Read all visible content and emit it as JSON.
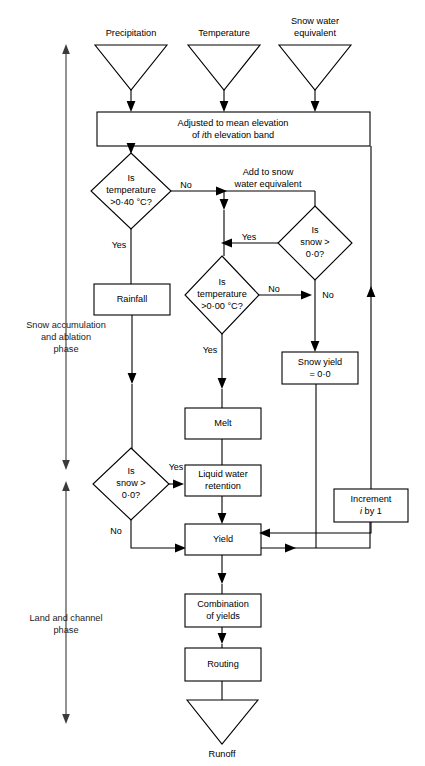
{
  "figure": {
    "type": "flowchart",
    "background_color": "#ffffff",
    "line_color": "#000000",
    "caption": ""
  },
  "inputs": [
    {
      "id": "precipitation",
      "label": "Precipitation",
      "shape": "triangle"
    },
    {
      "id": "temperature",
      "label": "Temperature",
      "shape": "triangle"
    },
    {
      "id": "snow-water-equivalent",
      "label_line1": "Snow water",
      "label_line2": "equivalent",
      "shape": "triangle"
    }
  ],
  "processes": {
    "adjusted": {
      "line1": "Adjusted to mean elevation",
      "line2_pre": "of ",
      "line2_italic": "i",
      "line2_post": "th elevation band"
    },
    "add_to_swe": {
      "line1": "Add to snow",
      "line2": "water equivalent"
    },
    "rainfall": {
      "line1": "Rainfall"
    },
    "snow_yield": {
      "line1": "Snow yield",
      "line2": "= 0·0"
    },
    "melt": {
      "line1": "Melt"
    },
    "liquid_water_retention": {
      "line1": "Liquid water",
      "line2": "retention"
    },
    "yield": {
      "line1": "Yield"
    },
    "increment": {
      "line1": "Increment",
      "line2_italic": "i",
      "line2_post": " by 1"
    },
    "combination": {
      "line1": "Combination",
      "line2": "of yields"
    },
    "routing": {
      "line1": "Routing"
    }
  },
  "decisions": {
    "temp_040": {
      "line1": "Is",
      "line2": "temperature",
      "line3": ">0·40 °C?"
    },
    "snow_top": {
      "line1": "Is",
      "line2": "snow >",
      "line3": "0·0?"
    },
    "temp_000": {
      "line1": "Is",
      "line2": "temperature",
      "line3": ">0·00 °C?"
    },
    "snow_bottom": {
      "line1": "Is",
      "line2": "snow >",
      "line3": "0·0?"
    }
  },
  "branch_labels": {
    "temp040_no": "No",
    "temp040_yes": "Yes",
    "snowtop_yes": "Yes",
    "snowtop_no": "No",
    "temp000_no": "No",
    "temp000_yes": "Yes",
    "snowbottom_yes": "Yes",
    "snowbottom_no": "No"
  },
  "output": {
    "runoff": {
      "label": "Runoff",
      "shape": "triangle"
    }
  },
  "phases": [
    {
      "id": "snow-phase",
      "line1": "Snow accumulation",
      "line2": "and ablation",
      "line3": "phase"
    },
    {
      "id": "land-phase",
      "line1": "Land and channel",
      "line2": "phase"
    }
  ]
}
